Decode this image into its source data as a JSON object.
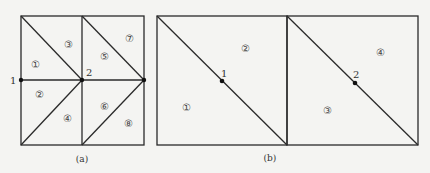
{
  "figure": {
    "panel_a": {
      "caption": "(a)",
      "nodes": [
        {
          "id": "1",
          "label": "1"
        },
        {
          "id": "2",
          "label": "2"
        }
      ],
      "elements": [
        "①",
        "②",
        "③",
        "④",
        "⑤",
        "⑥",
        "⑦",
        "⑧"
      ]
    },
    "panel_b": {
      "caption": "(b)",
      "nodes": [
        {
          "id": "1",
          "label": "1"
        },
        {
          "id": "2",
          "label": "2"
        }
      ],
      "elements": [
        "①",
        "②",
        "③",
        "④"
      ]
    }
  },
  "colors": {
    "line": "#2a2a2a",
    "background": "#f4f4f2",
    "node": "#111111"
  }
}
